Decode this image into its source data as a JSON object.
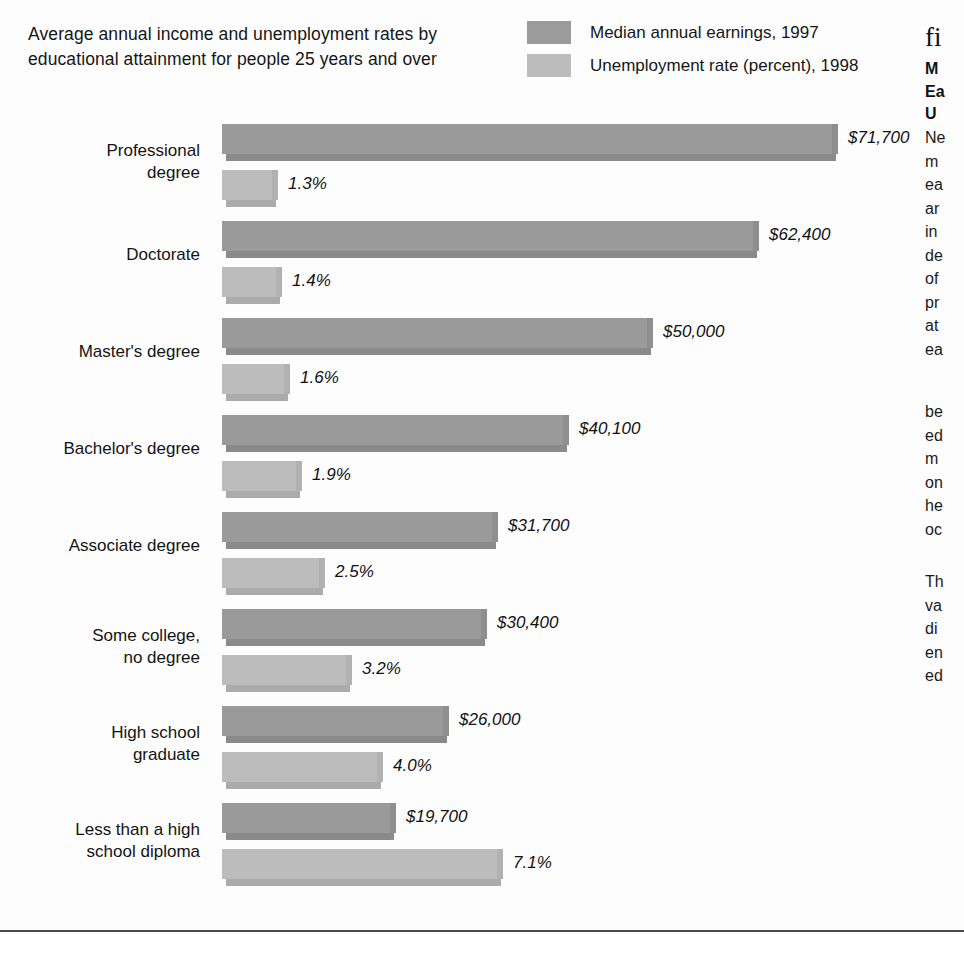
{
  "chart_data": {
    "type": "bar",
    "orientation": "horizontal",
    "title": "Average annual income and unemployment rates by educational attainment for people 25 years and over",
    "xlabel": "",
    "ylabel": "",
    "grid": false,
    "legend_position": "top-right",
    "categories": [
      "Professional\ndegree",
      "Doctorate",
      "Master's degree",
      "Bachelor's degree",
      "Associate degree",
      "Some college,\nno degree",
      "High school\ngraduate",
      "Less than a high\nschool diploma"
    ],
    "series": [
      {
        "name": "Median annual earnings, 1997",
        "color": "#9a9a9a",
        "unit": "USD",
        "values": [
          71700,
          62400,
          50000,
          40100,
          31700,
          30400,
          26000,
          19700
        ],
        "value_labels": [
          "$71,700",
          "$62,400",
          "$50,000",
          "$40,100",
          "$31,700",
          "$30,400",
          "$26,000",
          "$19,700"
        ],
        "max": 71700
      },
      {
        "name": "Unemployment rate (percent), 1998",
        "color": "#bcbcbc",
        "unit": "percent",
        "values": [
          1.3,
          1.4,
          1.6,
          1.9,
          2.5,
          3.2,
          4.0,
          7.1
        ],
        "value_labels": [
          "1.3%",
          "1.4%",
          "1.6%",
          "1.9%",
          "2.5%",
          "3.2%",
          "4.0%",
          "7.1%"
        ],
        "max": 7.1
      }
    ]
  },
  "legend": {
    "items": [
      {
        "label": "Median annual earnings, 1997",
        "color": "#9a9a9a"
      },
      {
        "label": "Unemployment rate (percent), 1998",
        "color": "#bcbcbc"
      }
    ]
  },
  "side_column": {
    "figure_marker": "fi",
    "heading": "M\nEa\nU",
    "body_1": "Ne\nm\nea\nar\nin\nde\nof\npr\nat\nea",
    "body_2": "be\ned\nm\non\nhe\noc",
    "body_3": "Th\nva\ndi\nen\ned"
  }
}
